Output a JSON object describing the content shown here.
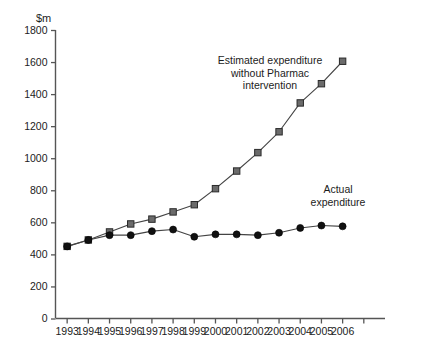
{
  "chart_data": {
    "type": "line",
    "title": "",
    "subtitle": "",
    "xlabel": "",
    "ylabel": "$m",
    "ylim": [
      0,
      1800
    ],
    "ytick_step": 200,
    "yticks": [
      0,
      200,
      400,
      600,
      800,
      1000,
      1200,
      1400,
      1600,
      1800
    ],
    "ytick_labels": [
      "0",
      "200",
      "400",
      "600",
      "800",
      "1000",
      "1200",
      "1400",
      "1600",
      "1800"
    ],
    "grid": false,
    "legend_position": "inline-annotations",
    "categories": [
      "1993",
      "1994",
      "1995",
      "1996",
      "1997",
      "1998",
      "1999",
      "2000",
      "2001",
      "2002",
      "2003",
      "2004",
      "2005",
      "2006"
    ],
    "extra_unlabeled_ticks": 1,
    "series": [
      {
        "name": "Estimated expenditure without Pharmac intervention",
        "marker": "square",
        "color": "#6b6b6b",
        "line_color": "#444444",
        "values": [
          450,
          490,
          540,
          590,
          620,
          665,
          710,
          810,
          920,
          1035,
          1165,
          1345,
          1465,
          1605
        ]
      },
      {
        "name": "Actual expenditure",
        "marker": "circle",
        "color": "#111111",
        "line_color": "#444444",
        "values": [
          450,
          490,
          520,
          520,
          545,
          555,
          510,
          525,
          525,
          520,
          535,
          565,
          580,
          575
        ]
      }
    ],
    "annotations": [
      {
        "id": "estimated-annotation",
        "lines": [
          "Estimated expenditure",
          "without Pharmac",
          "intervention"
        ],
        "x": 270,
        "y": 64
      },
      {
        "id": "actual-annotation",
        "lines": [
          "Actual",
          "expenditure"
        ],
        "x": 338,
        "y": 193
      }
    ]
  },
  "axis_unit_label": "$m"
}
